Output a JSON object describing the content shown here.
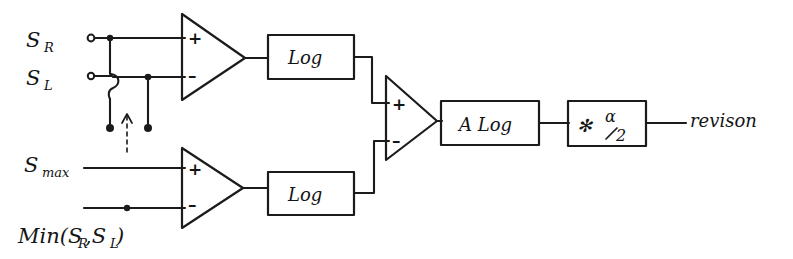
{
  "diagram": {
    "ink_color": "#1b1b1b",
    "background_color": "#ffffff",
    "inputs": [
      {
        "id": "s-r",
        "label": "S",
        "subscript": "R"
      },
      {
        "id": "s-l",
        "label": "S",
        "subscript": "L"
      },
      {
        "id": "s-max",
        "label": "S",
        "subscript": "max"
      },
      {
        "id": "min-srsl",
        "label": "Min(S",
        "subscript": "R",
        "label2": ",S",
        "subscript2": "L",
        "label3": ")"
      }
    ],
    "amplifiers": [
      {
        "id": "amp-top",
        "plus": "+",
        "minus": "–"
      },
      {
        "id": "amp-bottom",
        "plus": "+",
        "minus": "–"
      },
      {
        "id": "amp-center",
        "plus": "+",
        "minus": "–"
      }
    ],
    "blocks": [
      {
        "id": "log-top",
        "label": "Log"
      },
      {
        "id": "log-bottom",
        "label": "Log"
      },
      {
        "id": "antilog",
        "label": "A Log"
      },
      {
        "id": "gain",
        "symbol": "✻",
        "numerator": "α",
        "denominator": "2"
      }
    ],
    "output": {
      "id": "output",
      "label": "revison"
    },
    "annotations": {
      "switch_arrow": "up-arrow-dashed",
      "switch_note": "selector"
    }
  }
}
